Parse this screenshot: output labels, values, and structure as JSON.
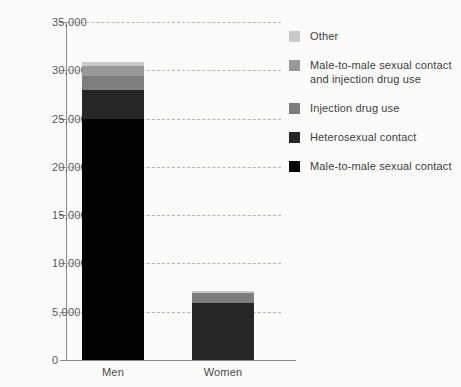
{
  "chart_data": {
    "type": "bar",
    "title": "",
    "subtitle": "",
    "xlabel": "",
    "ylabel": "",
    "stacked": true,
    "orientation": "vertical",
    "grid": true,
    "legend_position": "right",
    "categories": [
      "Men",
      "Women"
    ],
    "ylim": [
      0,
      35000
    ],
    "ytick_values": [
      0,
      5000,
      10000,
      15000,
      20000,
      25000,
      30000,
      35000
    ],
    "ytick_labels": [
      "0",
      "5,000",
      "10,000",
      "15,000",
      "20,000",
      "25,000",
      "30,000",
      "35,000"
    ],
    "series": [
      {
        "name": "Male-to-male sexual contact",
        "color": "#000000",
        "values": [
          25000,
          0
        ]
      },
      {
        "name": "Heterosexual contact",
        "color": "#262626",
        "values": [
          3000,
          5900
        ]
      },
      {
        "name": "Injection drug use",
        "color": "#7d7d7d",
        "values": [
          1400,
          1000
        ]
      },
      {
        "name": "Male-to-male sexual contact and injection drug use",
        "color": "#989898",
        "values": [
          1000,
          0
        ]
      },
      {
        "name": "Other",
        "color": "#c9c9c9",
        "values": [
          500,
          200
        ]
      }
    ],
    "totals": [
      30900,
      7100
    ]
  },
  "legend": {
    "items": [
      {
        "label": "Other",
        "color": "#c9c9c9"
      },
      {
        "label": "Male-to-male sexual contact and injection drug use",
        "color": "#989898"
      },
      {
        "label": "Injection drug use",
        "color": "#7d7d7d"
      },
      {
        "label": "Heterosexual contact",
        "color": "#262626"
      },
      {
        "label": "Male-to-male sexual contact",
        "color": "#000000"
      }
    ]
  },
  "axis": {
    "grid_color": "#b9b6b2",
    "axis_color": "#8c8c8c",
    "tick_text_color": "#595959"
  }
}
